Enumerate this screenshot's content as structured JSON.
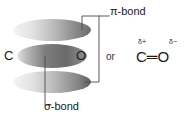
{
  "diagram": {
    "type": "orbital-diagram",
    "background_color": "#ffffff",
    "atoms": {
      "left_label": "C",
      "right_label": "O"
    },
    "orbitals": [
      {
        "name": "pi-orbital-top",
        "role": "upper pi lobe",
        "cx": 52,
        "cy": 30,
        "rx": 39,
        "ry": 11,
        "gradient_light": "#f2f2f2",
        "gradient_dark": "#6f6f6f"
      },
      {
        "name": "sigma-orbital-middle",
        "role": "sigma bond lobe",
        "cx": 52,
        "cy": 56,
        "rx": 35,
        "ry": 12,
        "gradient_light": "#e0e0e0",
        "gradient_dark": "#5a5a5a"
      },
      {
        "name": "pi-orbital-bottom",
        "role": "lower pi lobe",
        "cx": 52,
        "cy": 82,
        "rx": 39,
        "ry": 11,
        "gradient_light": "#f2f2f2",
        "gradient_dark": "#6f6f6f"
      }
    ],
    "callouts": {
      "pi_bond": "π-bond",
      "sigma_bond": "σ-bond"
    },
    "connector_color": "#4a4a4a",
    "alternative": {
      "conjunction": "or",
      "delta_positive": "δ+",
      "delta_negative": "δ−",
      "formula": "C═O",
      "formula_left_atom": "C",
      "formula_right_atom": "O",
      "bond_order": 2
    }
  }
}
